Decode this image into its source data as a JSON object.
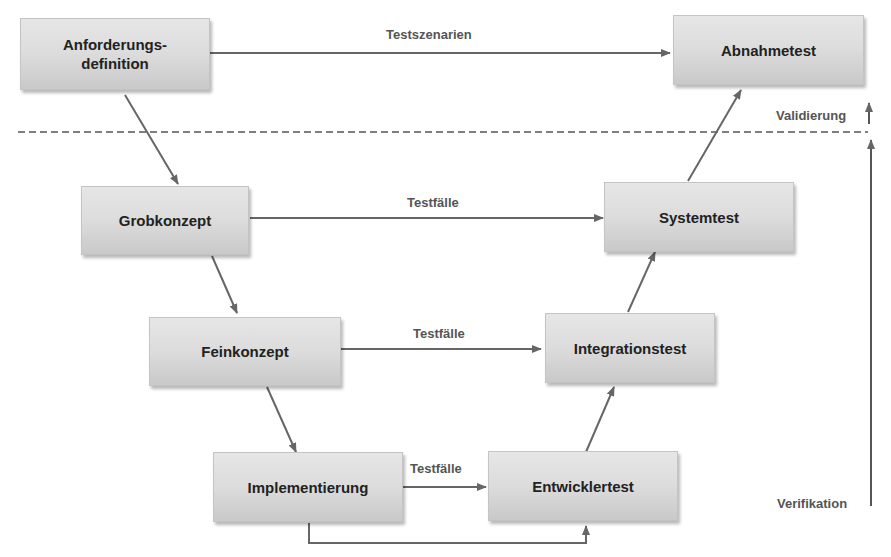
{
  "diagram": {
    "type": "V-Modell",
    "left_phases": [
      {
        "id": "anforderungsdefinition",
        "label_line1": "Anforderungs-",
        "label_line2": "definition"
      },
      {
        "id": "grobkonzept",
        "label": "Grobkonzept"
      },
      {
        "id": "feinkonzept",
        "label": "Feinkonzept"
      },
      {
        "id": "implementierung",
        "label": "Implementierung"
      }
    ],
    "right_phases": [
      {
        "id": "abnahmetest",
        "label": "Abnahmetest"
      },
      {
        "id": "systemtest",
        "label": "Systemtest"
      },
      {
        "id": "integrationstest",
        "label": "Integrationstest"
      },
      {
        "id": "entwicklertest",
        "label": "Entwicklertest"
      }
    ],
    "edge_labels": {
      "anforderung_to_abnahme": "Testszenarien",
      "grob_to_system": "Testfälle",
      "fein_to_integration": "Testfälle",
      "impl_to_entwickler": "Testfälle"
    },
    "axis_labels": {
      "validierung": "Validierung",
      "verifikation": "Verifikation"
    },
    "colors": {
      "box_top": "#e6e6e6",
      "box_bottom": "#c9c9c9",
      "line": "#666666",
      "label_text": "#555555",
      "box_text": "#222222"
    }
  }
}
